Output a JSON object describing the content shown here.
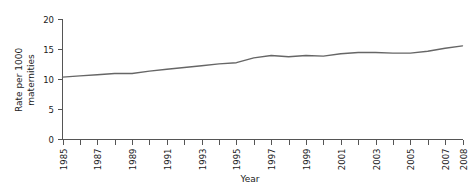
{
  "chart_data": {
    "type": "line",
    "title": "",
    "xlabel": "Year",
    "ylabel": "Rate per 1000 maternities",
    "ylabel_line1": "Rate per 1000",
    "ylabel_line2": "maternities",
    "x": [
      1985,
      1986,
      1987,
      1988,
      1989,
      1990,
      1991,
      1992,
      1993,
      1994,
      1995,
      1996,
      1997,
      1998,
      1999,
      2000,
      2001,
      2002,
      2003,
      2004,
      2005,
      2006,
      2007,
      2008
    ],
    "values": [
      10.4,
      10.6,
      10.8,
      11.0,
      11.0,
      11.4,
      11.7,
      12.0,
      12.3,
      12.6,
      12.8,
      13.6,
      14.0,
      13.8,
      14.0,
      13.9,
      14.3,
      14.5,
      14.5,
      14.4,
      14.4,
      14.7,
      15.2,
      15.6
    ],
    "series": [
      {
        "name": "Rate per 1000 maternities",
        "values": [
          10.4,
          10.6,
          10.8,
          11.0,
          11.0,
          11.4,
          11.7,
          12.0,
          12.3,
          12.6,
          12.8,
          13.6,
          14.0,
          13.8,
          14.0,
          13.9,
          14.3,
          14.5,
          14.5,
          14.4,
          14.4,
          14.7,
          15.2,
          15.6
        ]
      }
    ],
    "xlim": [
      1985,
      2008
    ],
    "ylim": [
      0,
      20
    ],
    "ytick_values": [
      0,
      5,
      10,
      15,
      20
    ],
    "ytick_labels": [
      "0",
      "5",
      "10",
      "15",
      "20"
    ],
    "xtick_values": [
      1985,
      1986,
      1987,
      1988,
      1989,
      1990,
      1991,
      1992,
      1993,
      1994,
      1995,
      1996,
      1997,
      1998,
      1999,
      2000,
      2001,
      2002,
      2003,
      2004,
      2005,
      2006,
      2007,
      2008
    ],
    "xtick_labels": [
      "1985",
      "",
      "1987",
      "",
      "1989",
      "",
      "1991",
      "",
      "1993",
      "",
      "1995",
      "",
      "1997",
      "",
      "1999",
      "",
      "2001",
      "",
      "2003",
      "",
      "2005",
      "",
      "2007",
      "2008"
    ],
    "grid": false,
    "legend": false,
    "legend_position": "none",
    "line_color": "#666666",
    "axis_color": "#555555",
    "background_color": "#ffffff"
  }
}
